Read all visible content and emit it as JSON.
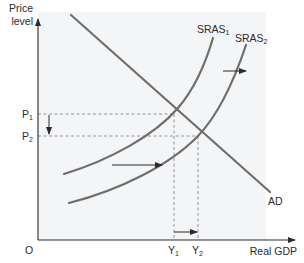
{
  "diagram": {
    "type": "economics-ad-as",
    "title": "",
    "y_axis_label_line1": "Price",
    "y_axis_label_line2": "level",
    "x_axis_label": "Real GDP",
    "origin_label": "O",
    "price_levels": [
      {
        "base": "P",
        "sub": "1"
      },
      {
        "base": "P",
        "sub": "2"
      }
    ],
    "output_levels": [
      {
        "base": "Y",
        "sub": "1"
      },
      {
        "base": "Y",
        "sub": "2"
      }
    ],
    "curves": [
      {
        "name": "SRAS1",
        "base": "SRAS",
        "sub": "1",
        "type": "short-run aggregate supply (initial)"
      },
      {
        "name": "SRAS2",
        "base": "SRAS",
        "sub": "2",
        "type": "short-run aggregate supply (shifted right)"
      },
      {
        "name": "AD",
        "base": "AD",
        "sub": "",
        "type": "aggregate demand"
      }
    ],
    "shifts": [
      "SRAS shifts right from SRAS1 to SRAS2",
      "Price level falls from P1 to P2",
      "Real GDP rises from Y1 to Y2"
    ],
    "colors": {
      "curve": "#6e6e6e",
      "axis": "#2b2b2b",
      "panel": "#f4f5f7",
      "dashed": "#8a8a8a",
      "text": "#2b2b2b"
    }
  }
}
